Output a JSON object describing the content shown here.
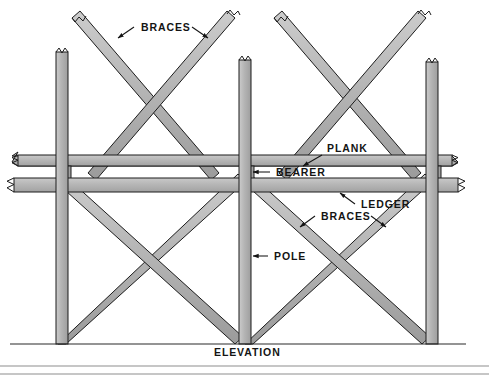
{
  "figure": {
    "title_caption": "ELEVATION",
    "view_type": "elevation"
  },
  "labels": {
    "braces_top": "BRACES",
    "plank": "PLANK",
    "bearer": "BEARER",
    "ledger": "LEDGER",
    "braces_bottom": "BRACES",
    "pole": "POLE",
    "elevation": "ELEVATION"
  },
  "colors": {
    "member_fill": "#b4b4b4",
    "member_fill_light": "#c8c8c8",
    "member_fill_dark": "#9a9a9a",
    "outline": "#1c1c1c",
    "background": "#ffffff",
    "ground": "#2b2b2b",
    "frame": "#8d8d8d",
    "text": "#141414"
  },
  "geometry": {
    "canvas_width": 489,
    "canvas_height": 375,
    "ground_y": 344,
    "poles_x": [
      62,
      245,
      432
    ],
    "plank_y": 160,
    "bearer_y": 172,
    "ledger_y": 186
  },
  "members": {
    "pole_count": 3,
    "brace_count_upper": 4,
    "brace_count_lower": 4,
    "horizontal_members": [
      "plank",
      "bearer",
      "ledger"
    ]
  }
}
